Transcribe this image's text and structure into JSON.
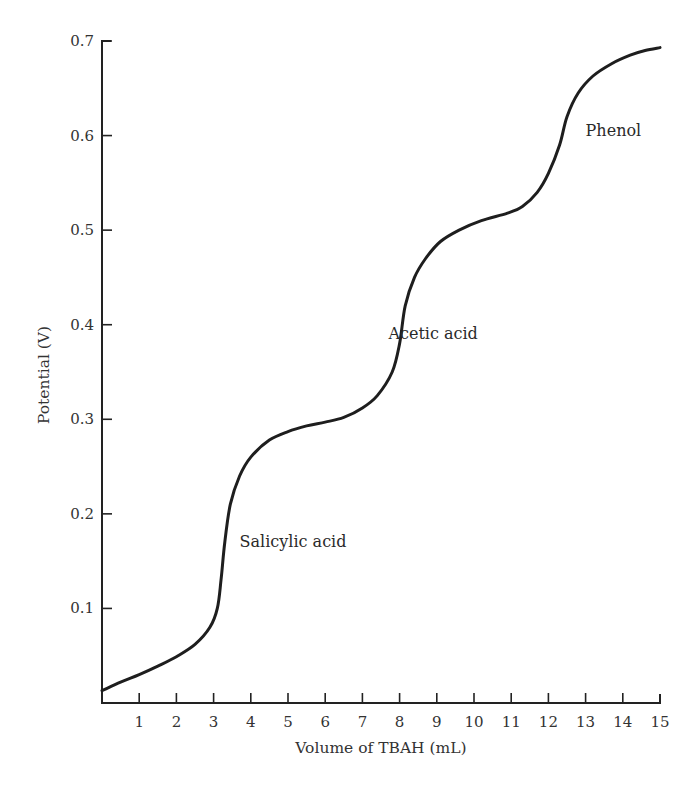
{
  "chart_data": {
    "type": "line",
    "title": "",
    "xlabel": "Volume of TBAH (mL)",
    "ylabel": "Potential (V)",
    "xlim": [
      0,
      15
    ],
    "ylim": [
      0,
      0.7
    ],
    "grid": false,
    "legend": null,
    "x_ticks": [
      1,
      2,
      3,
      4,
      5,
      6,
      7,
      8,
      9,
      10,
      11,
      12,
      13,
      14,
      15
    ],
    "x_tick_labels": [
      "1",
      "2",
      "3",
      "4",
      "5",
      "6",
      "7",
      "8",
      "9",
      "10",
      "11",
      "12",
      "13",
      "14",
      "15"
    ],
    "y_ticks": [
      0.1,
      0.2,
      0.3,
      0.4,
      0.5,
      0.6,
      0.7
    ],
    "y_tick_labels": [
      "0.1",
      "0.2",
      "0.3",
      "0.4",
      "0.5",
      "0.6",
      "0.7"
    ],
    "series": [
      {
        "name": "Titration curve",
        "x": [
          0.0,
          0.5,
          1.0,
          1.5,
          2.0,
          2.5,
          2.9,
          3.1,
          3.2,
          3.3,
          3.45,
          3.7,
          4.0,
          4.5,
          5.0,
          5.5,
          6.0,
          6.5,
          7.0,
          7.4,
          7.8,
          8.0,
          8.15,
          8.4,
          8.7,
          9.1,
          9.6,
          10.2,
          10.9,
          11.3,
          11.7,
          12.0,
          12.3,
          12.5,
          12.8,
          13.2,
          13.7,
          14.2,
          14.6,
          15.0
        ],
        "y": [
          0.013,
          0.022,
          0.03,
          0.039,
          0.049,
          0.062,
          0.08,
          0.1,
          0.13,
          0.17,
          0.21,
          0.24,
          0.26,
          0.278,
          0.287,
          0.293,
          0.297,
          0.302,
          0.312,
          0.325,
          0.35,
          0.38,
          0.42,
          0.45,
          0.47,
          0.488,
          0.5,
          0.51,
          0.518,
          0.525,
          0.54,
          0.56,
          0.59,
          0.62,
          0.645,
          0.663,
          0.676,
          0.685,
          0.69,
          0.693
        ]
      }
    ],
    "annotations": [
      {
        "text": "Salicylic acid",
        "x": 3.7,
        "y": 0.165
      },
      {
        "text": "Acetic acid",
        "x": 7.7,
        "y": 0.385
      },
      {
        "text": "Phenol",
        "x": 13.0,
        "y": 0.6
      }
    ]
  },
  "labels": {
    "xlabel": "Volume of TBAH (mL)",
    "ylabel": "Potential (V)",
    "salicylic": "Salicylic acid",
    "acetic": "Acetic acid",
    "phenol": "Phenol"
  },
  "colors": {
    "curve": "#1e1e1e",
    "axis": "#222222",
    "text": "#333333",
    "background": "#ffffff"
  }
}
